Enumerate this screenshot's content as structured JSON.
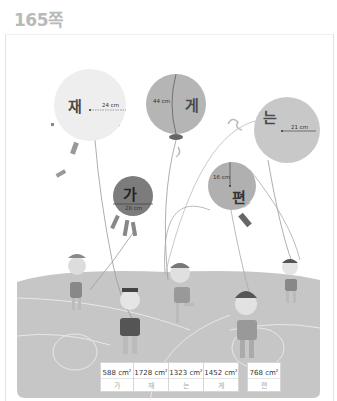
{
  "page": {
    "number_label": "165쪽"
  },
  "balloons": [
    {
      "id": "jae",
      "letter": "재",
      "dimension": "24 cm",
      "dim_type": "radius",
      "color": "#eeeeee"
    },
    {
      "id": "ge",
      "letter": "게",
      "dimension": "44 cm",
      "dim_type": "diameter",
      "color": "#b5b5b5"
    },
    {
      "id": "neun",
      "letter": "는",
      "dimension": "21 cm",
      "dim_type": "radius",
      "color": "#c8c8c8"
    },
    {
      "id": "ga",
      "letter": "가",
      "dimension": "28 cm",
      "dim_type": "diameter",
      "color": "#7c7c7c"
    },
    {
      "id": "pyeon",
      "letter": "편",
      "dimension": "16 cm",
      "dim_type": "radius",
      "color": "#b0b0b0"
    }
  ],
  "answer_table": {
    "group1": [
      {
        "area": "588 cm",
        "sup": "2",
        "answer": "가"
      },
      {
        "area": "1728 cm",
        "sup": "2",
        "answer": "재"
      },
      {
        "area": "1323 cm",
        "sup": "2",
        "answer": "는"
      }
    ],
    "group2": [
      {
        "area": "1452 cm",
        "sup": "2",
        "answer": "게"
      },
      {
        "area": "768 cm",
        "sup": "2",
        "answer": "편"
      }
    ]
  }
}
